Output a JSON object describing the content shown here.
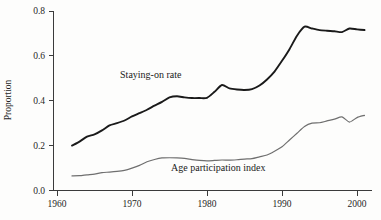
{
  "chart_data": {
    "type": "line",
    "title": "",
    "xlabel": "",
    "ylabel": "Proportion",
    "xlim": [
      1960,
      2001
    ],
    "ylim": [
      0.0,
      0.8
    ],
    "grid": false,
    "legend_position": "inline-annotation",
    "x_ticks": [
      "1960",
      "1970",
      "1980",
      "1990",
      "2000"
    ],
    "x_tick_values": [
      1960,
      1970,
      1980,
      1990,
      2000
    ],
    "y_ticks": [
      "0.0",
      "0.2",
      "0.4",
      "0.6",
      "0.8"
    ],
    "y_tick_values": [
      0.0,
      0.2,
      0.4,
      0.6,
      0.8
    ],
    "annotations": [
      {
        "text": "Staying-on rate",
        "x": 1972.5,
        "y": 0.5
      },
      {
        "text": "Age participation index",
        "x": 1981.5,
        "y": 0.085
      }
    ],
    "x": [
      1962,
      1963,
      1964,
      1965,
      1966,
      1967,
      1968,
      1969,
      1970,
      1971,
      1972,
      1973,
      1974,
      1975,
      1976,
      1977,
      1978,
      1979,
      1980,
      1981,
      1982,
      1983,
      1984,
      1985,
      1986,
      1987,
      1988,
      1989,
      1990,
      1991,
      1992,
      1993,
      1994,
      1995,
      1996,
      1997,
      1998,
      1999,
      2000,
      2001
    ],
    "series": [
      {
        "name": "Staying-on rate",
        "color": "#1a1a1a",
        "linewidth": 1.9,
        "values": [
          0.2,
          0.218,
          0.24,
          0.25,
          0.268,
          0.29,
          0.3,
          0.312,
          0.33,
          0.345,
          0.36,
          0.378,
          0.395,
          0.415,
          0.42,
          0.415,
          0.412,
          0.412,
          0.413,
          0.44,
          0.47,
          0.455,
          0.45,
          0.448,
          0.452,
          0.468,
          0.495,
          0.53,
          0.578,
          0.63,
          0.69,
          0.73,
          0.722,
          0.715,
          0.712,
          0.71,
          0.706,
          0.722,
          0.718,
          0.715
        ]
      },
      {
        "name": "Age participation index",
        "color": "#6f6f6f",
        "linewidth": 1.2,
        "values": [
          0.065,
          0.066,
          0.07,
          0.073,
          0.08,
          0.082,
          0.085,
          0.09,
          0.1,
          0.112,
          0.128,
          0.138,
          0.145,
          0.146,
          0.145,
          0.143,
          0.138,
          0.134,
          0.132,
          0.134,
          0.136,
          0.135,
          0.137,
          0.14,
          0.142,
          0.15,
          0.158,
          0.175,
          0.195,
          0.225,
          0.255,
          0.285,
          0.3,
          0.302,
          0.31,
          0.318,
          0.328,
          0.305,
          0.325,
          0.335
        ]
      }
    ]
  },
  "labels": {
    "y_axis_title": "Proportion",
    "series_one_label": "Staying-on rate",
    "series_two_label": "Age participation index",
    "y_tick_0": "0.0",
    "y_tick_1": "0.2",
    "y_tick_2": "0.4",
    "y_tick_3": "0.6",
    "y_tick_4": "0.8",
    "x_tick_0": "1960",
    "x_tick_1": "1970",
    "x_tick_2": "1980",
    "x_tick_3": "1990",
    "x_tick_4": "2000"
  }
}
